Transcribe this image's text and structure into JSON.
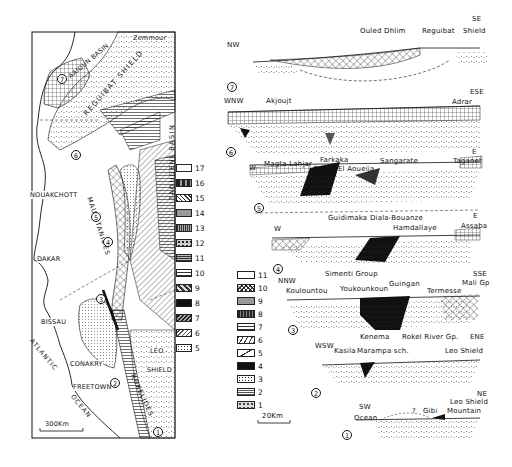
{
  "map": {
    "labels": {
      "aaioun_basin": "AAIOUN BASIN",
      "zemmour": "Zemmour",
      "reguibat_shield": "REGUIBAT SHIELD",
      "nouakchott": "NOUAKCHOTT",
      "mauritanides": "MAURITANIDES",
      "taoudeni_basin": "TAOUDENI BASIN",
      "dakar": "DAKAR",
      "bissau": "BISSAU",
      "atlantic": "ATLANTIC",
      "ocean": "OCEAN",
      "conakry": "CONAKRY",
      "freetown": "FREETOWN",
      "leo_shield_1": "LEO",
      "leo_shield_2": "SHIELD",
      "rokelides": "ROKELIDES",
      "scale": "300Km"
    },
    "section_markers": [
      "1",
      "2",
      "3",
      "4",
      "5",
      "6",
      "7"
    ],
    "legend": [
      {
        "num": "17",
        "pattern": "blank"
      },
      {
        "num": "16",
        "pattern": "dark-mixed"
      },
      {
        "num": "15",
        "pattern": "diagonal"
      },
      {
        "num": "14",
        "pattern": "stipple-gray"
      },
      {
        "num": "13",
        "pattern": "vertical-lines"
      },
      {
        "num": "12",
        "pattern": "spotted"
      },
      {
        "num": "11",
        "pattern": "horizontal-lines-dense"
      },
      {
        "num": "10",
        "pattern": "horizontal-lines"
      },
      {
        "num": "9",
        "pattern": "checker"
      },
      {
        "num": "8",
        "pattern": "solid-black"
      },
      {
        "num": "7",
        "pattern": "hatched-dark"
      },
      {
        "num": "6",
        "pattern": "diagonal-light"
      },
      {
        "num": "5",
        "pattern": "dotted-box"
      }
    ]
  },
  "sections": {
    "s7": {
      "num": "7",
      "left": "NW",
      "right_dir": "SE",
      "right": "Shield",
      "labels": [
        "Ouled Dhlim",
        "Reguibat"
      ]
    },
    "s6": {
      "num": "6",
      "left": "WNW",
      "right": "ESE",
      "labels": [
        "Akjoujt",
        "Adrar"
      ]
    },
    "s5": {
      "num": "5",
      "left": "W",
      "right": "E",
      "labels": [
        "Magta Lahjar",
        "Farkaka",
        "Gaoua",
        "El Aoueija",
        "Sangarate",
        "Taganet"
      ]
    },
    "s4": {
      "num": "4",
      "left": "W",
      "right": "E",
      "labels": [
        "Guidimaka",
        "Diala-Bouanze",
        "Hamdallaye",
        "Assaba"
      ]
    },
    "s3": {
      "num": "3",
      "left": "NNW",
      "right": "SSE",
      "labels": [
        "Simenti Group",
        "Kouloun­tou",
        "Youkounkoun",
        "Guingan",
        "Termesse",
        "Mali Gp"
      ]
    },
    "s2": {
      "num": "2",
      "left": "WSW",
      "right": "ENE",
      "labels": [
        "Kenema",
        "Rokel River Gp.",
        "Kasila",
        "Marampa sch.",
        "Leo Shield"
      ]
    },
    "s1": {
      "num": "1",
      "left": "SW",
      "right": "NE",
      "labels": [
        "Ocean",
        "?",
        "Gibi",
        "Mountain",
        "Leo Shield"
      ]
    },
    "scale": "20Km"
  },
  "section_legend": [
    {
      "num": "11",
      "pattern": "blank"
    },
    {
      "num": "10",
      "pattern": "crosshatch"
    },
    {
      "num": "9",
      "pattern": "brick-gray"
    },
    {
      "num": "8",
      "pattern": "dark-vertical"
    },
    {
      "num": "7",
      "pattern": "brick"
    },
    {
      "num": "6",
      "pattern": "slashes"
    },
    {
      "num": "5",
      "pattern": "diag-dash"
    },
    {
      "num": "4",
      "pattern": "solid-black"
    },
    {
      "num": "3",
      "pattern": "speckled"
    },
    {
      "num": "2",
      "pattern": "wavy"
    },
    {
      "num": "1",
      "pattern": "v-marks"
    }
  ]
}
